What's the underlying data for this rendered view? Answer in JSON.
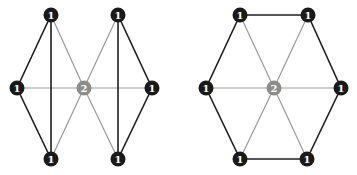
{
  "colors": {
    "background": "#ffffff",
    "node_fill": "#1a1a1a",
    "center_node_fill": "#8c8c8c",
    "outer_edge": "#1e1e1e",
    "spoke_edge": "#9a9a9a",
    "label": "#ffffff"
  },
  "diagrams": [
    {
      "name": "bowtie-graph",
      "nodes": [
        {
          "id": "tl",
          "x": 51,
          "y": 15,
          "label": "1",
          "type": "outer"
        },
        {
          "id": "tr",
          "x": 118,
          "y": 15,
          "label": "1",
          "type": "outer"
        },
        {
          "id": "l",
          "x": 17,
          "y": 88,
          "label": "1",
          "type": "outer"
        },
        {
          "id": "c",
          "x": 84,
          "y": 88,
          "label": "2",
          "type": "center"
        },
        {
          "id": "r",
          "x": 152,
          "y": 88,
          "label": "1",
          "type": "outer"
        },
        {
          "id": "bl",
          "x": 51,
          "y": 159,
          "label": "1",
          "type": "outer"
        },
        {
          "id": "br",
          "x": 118,
          "y": 159,
          "label": "1",
          "type": "outer"
        }
      ],
      "edges": [
        {
          "from": "l",
          "to": "tl",
          "style": "outer"
        },
        {
          "from": "l",
          "to": "bl",
          "style": "outer"
        },
        {
          "from": "tl",
          "to": "bl",
          "style": "outer"
        },
        {
          "from": "r",
          "to": "tr",
          "style": "outer"
        },
        {
          "from": "r",
          "to": "br",
          "style": "outer"
        },
        {
          "from": "tr",
          "to": "br",
          "style": "outer"
        },
        {
          "from": "c",
          "to": "tl",
          "style": "spoke"
        },
        {
          "from": "c",
          "to": "tr",
          "style": "spoke"
        },
        {
          "from": "c",
          "to": "l",
          "style": "spoke"
        },
        {
          "from": "c",
          "to": "r",
          "style": "spoke"
        },
        {
          "from": "c",
          "to": "bl",
          "style": "spoke"
        },
        {
          "from": "c",
          "to": "br",
          "style": "spoke"
        }
      ]
    },
    {
      "name": "hexagon-wheel-graph",
      "nodes": [
        {
          "id": "tl",
          "x": 240,
          "y": 15,
          "label": "1",
          "type": "outer"
        },
        {
          "id": "tr",
          "x": 308,
          "y": 15,
          "label": "1",
          "type": "outer"
        },
        {
          "id": "l",
          "x": 206,
          "y": 88,
          "label": "1",
          "type": "outer"
        },
        {
          "id": "c",
          "x": 274,
          "y": 88,
          "label": "2",
          "type": "center"
        },
        {
          "id": "r",
          "x": 341,
          "y": 88,
          "label": "1",
          "type": "outer"
        },
        {
          "id": "bl",
          "x": 240,
          "y": 159,
          "label": "1",
          "type": "outer"
        },
        {
          "id": "br",
          "x": 307,
          "y": 159,
          "label": "1",
          "type": "outer"
        }
      ],
      "edges": [
        {
          "from": "tl",
          "to": "tr",
          "style": "outer"
        },
        {
          "from": "tr",
          "to": "r",
          "style": "outer"
        },
        {
          "from": "r",
          "to": "br",
          "style": "outer"
        },
        {
          "from": "br",
          "to": "bl",
          "style": "outer"
        },
        {
          "from": "bl",
          "to": "l",
          "style": "outer"
        },
        {
          "from": "l",
          "to": "tl",
          "style": "outer"
        },
        {
          "from": "c",
          "to": "tl",
          "style": "spoke"
        },
        {
          "from": "c",
          "to": "tr",
          "style": "spoke"
        },
        {
          "from": "c",
          "to": "l",
          "style": "spoke"
        },
        {
          "from": "c",
          "to": "r",
          "style": "spoke"
        },
        {
          "from": "c",
          "to": "bl",
          "style": "spoke"
        },
        {
          "from": "c",
          "to": "br",
          "style": "spoke"
        }
      ]
    }
  ]
}
